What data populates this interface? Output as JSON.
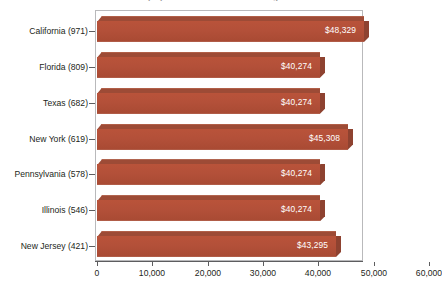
{
  "chart_data": {
    "type": "bar",
    "orientation": "horizontal",
    "title": "Median Salary by State for Retail Store Managers",
    "xlabel": "",
    "ylabel": "",
    "categories": [
      "California (971)",
      "Florida (809)",
      "Texas (682)",
      "New York (619)",
      "Pennsylvania (578)",
      "Illinois (546)",
      "New Jersey (421)"
    ],
    "values": [
      48329,
      40274,
      40274,
      45308,
      40274,
      40274,
      43295
    ],
    "value_labels": [
      "$48,329",
      "$40,274",
      "$40,274",
      "$45,308",
      "$40,274",
      "$40,274",
      "$43,295"
    ],
    "xlim": [
      0,
      60000
    ],
    "xticks": [
      0,
      10000,
      20000,
      30000,
      40000,
      50000,
      60000
    ],
    "xtick_labels": [
      "0",
      "10,000",
      "20,000",
      "30,000",
      "40,000",
      "50,000",
      "60,000"
    ],
    "grid": false,
    "legend": false,
    "bar_color": "#b35039",
    "bar_top_color": "#9d4b36",
    "bar_side_color": "#8e4230",
    "value_label_color": "#ffffff",
    "frame_color": "#b9b9bb",
    "background": "#ffffff"
  }
}
